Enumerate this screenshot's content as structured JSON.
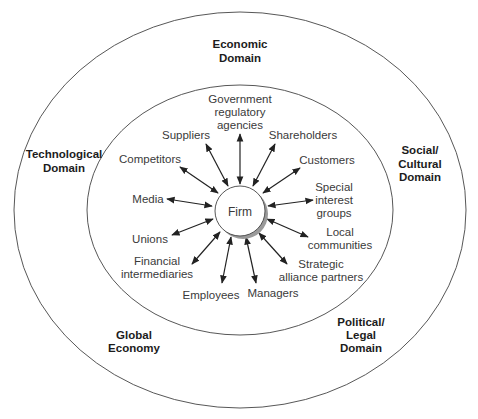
{
  "diagram": {
    "title": "",
    "center": {
      "label": "Firm"
    },
    "outer_domains": [
      {
        "id": "economic",
        "lines": [
          "Economic",
          "Domain"
        ]
      },
      {
        "id": "technological",
        "lines": [
          "Technological",
          "Domain"
        ]
      },
      {
        "id": "social-cultural",
        "lines": [
          "Social/",
          "Cultural",
          "Domain"
        ]
      },
      {
        "id": "global-economy",
        "lines": [
          "Global",
          "Economy"
        ]
      },
      {
        "id": "political-legal",
        "lines": [
          "Political/",
          "Legal",
          "Domain"
        ]
      }
    ],
    "stakeholders": [
      {
        "id": "government",
        "lines": [
          "Government",
          "regulatory",
          "agencies"
        ]
      },
      {
        "id": "suppliers",
        "lines": [
          "Suppliers"
        ]
      },
      {
        "id": "shareholders",
        "lines": [
          "Shareholders"
        ]
      },
      {
        "id": "competitors",
        "lines": [
          "Competitors"
        ]
      },
      {
        "id": "customers",
        "lines": [
          "Customers"
        ]
      },
      {
        "id": "media",
        "lines": [
          "Media"
        ]
      },
      {
        "id": "special-interest",
        "lines": [
          "Special",
          "interest",
          "groups"
        ]
      },
      {
        "id": "unions",
        "lines": [
          "Unions"
        ]
      },
      {
        "id": "local-communities",
        "lines": [
          "Local",
          "communities"
        ]
      },
      {
        "id": "financial",
        "lines": [
          "Financial",
          "intermediaries"
        ]
      },
      {
        "id": "strategic-alliance",
        "lines": [
          "Strategic",
          "alliance partners"
        ]
      },
      {
        "id": "employees",
        "lines": [
          "Employees"
        ]
      },
      {
        "id": "managers",
        "lines": [
          "Managers"
        ]
      }
    ],
    "relationships": "bidirectional arrows between Firm and each stakeholder",
    "colors": {
      "lines": "#333333",
      "text": "#3a3a3a",
      "domain_text": "#1c1c1c",
      "shadow": "#9a9a9a"
    }
  }
}
